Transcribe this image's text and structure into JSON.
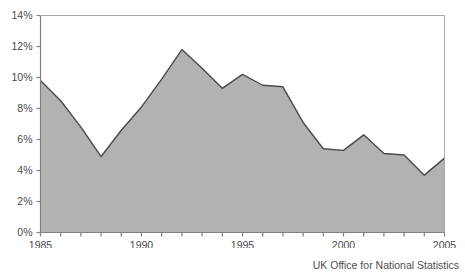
{
  "chart_data": {
    "type": "area",
    "title": "",
    "subtitle": "",
    "xlabel": "",
    "ylabel": "",
    "x": [
      1985,
      1986,
      1987,
      1988,
      1989,
      1990,
      1991,
      1992,
      1993,
      1994,
      1995,
      1996,
      1997,
      1998,
      1999,
      2000,
      2001,
      2002,
      2003,
      2004,
      2005
    ],
    "values": [
      9.8,
      8.5,
      6.8,
      4.9,
      6.6,
      8.1,
      9.9,
      11.8,
      10.6,
      9.3,
      10.2,
      9.5,
      9.4,
      7.1,
      5.4,
      5.3,
      6.3,
      5.1,
      5.0,
      3.7,
      4.8
    ],
    "series": [
      {
        "name": "",
        "values": [
          9.8,
          8.5,
          6.8,
          4.9,
          6.6,
          8.1,
          9.9,
          11.8,
          10.6,
          9.3,
          10.2,
          9.5,
          9.4,
          7.1,
          5.4,
          5.3,
          6.3,
          5.1,
          5.0,
          3.7,
          4.8
        ]
      }
    ],
    "xlim": [
      1985,
      2005
    ],
    "ylim": [
      0,
      14
    ],
    "ytick_values": [
      0,
      2,
      4,
      6,
      8,
      10,
      12,
      14
    ],
    "ytick_labels": [
      "0%",
      "2%",
      "4%",
      "6%",
      "8%",
      "10%",
      "12%",
      "14%"
    ],
    "xtick_values": [
      1985,
      1986,
      1987,
      1988,
      1989,
      1990,
      1991,
      1992,
      1993,
      1994,
      1995,
      1996,
      1997,
      1998,
      1999,
      2000,
      2001,
      2002,
      2003,
      2004,
      2005
    ],
    "xtick_labels_shown": [
      "1985",
      "1990",
      "1995",
      "2000",
      "2005"
    ],
    "xtick_label_values": [
      1985,
      1990,
      1995,
      2000,
      2005
    ],
    "grid": false,
    "legend": false,
    "legend_position": "none",
    "area_fill_color": "#b2b2b2",
    "line_color": "#4a4a4a",
    "axis_color": "#808080",
    "background_color": "#ffffff"
  },
  "footer": {
    "source": "UK Office for National Statistics"
  }
}
